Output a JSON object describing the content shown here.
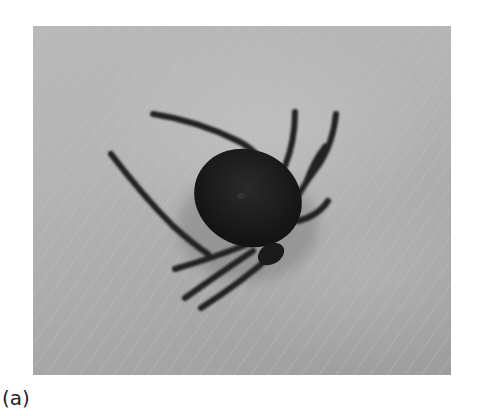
{
  "figure": {
    "panel_label": "(a)",
    "photo": {
      "subject": "tick on human skin",
      "style": "grayscale photograph",
      "background_color": "#b2b2b2",
      "subject_color": "#1c1c1c"
    }
  }
}
